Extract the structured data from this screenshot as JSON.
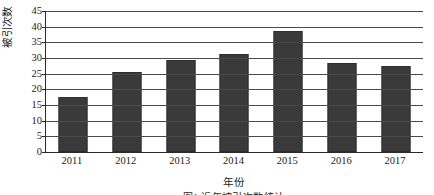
{
  "chart_data": {
    "type": "bar",
    "title": "",
    "xlabel": "年份",
    "ylabel": "被引次数",
    "categories": [
      "2011",
      "2012",
      "2013",
      "2014",
      "2015",
      "2016",
      "2017"
    ],
    "values": [
      17.5,
      25.5,
      29.5,
      31.3,
      38.5,
      28.5,
      27.3
    ],
    "ylim": [
      0,
      45
    ],
    "ytick_labels": [
      "0",
      "5",
      "10",
      "15",
      "20",
      "25",
      "30",
      "35",
      "40",
      "45"
    ],
    "ytick_values": [
      0,
      5,
      10,
      15,
      20,
      25,
      30,
      35,
      40,
      45
    ],
    "grid": true,
    "legend": "none",
    "bar_color": "#3a3a3a",
    "axis_color": "#2a2a2a",
    "grid_color": "#4a4a4a",
    "series": [
      {
        "name": "被引次数",
        "values": [
          17.5,
          25.5,
          29.5,
          31.3,
          38.5,
          28.5,
          27.3
        ]
      }
    ]
  },
  "caption": {
    "text": "图1 近年被引次数统计"
  }
}
